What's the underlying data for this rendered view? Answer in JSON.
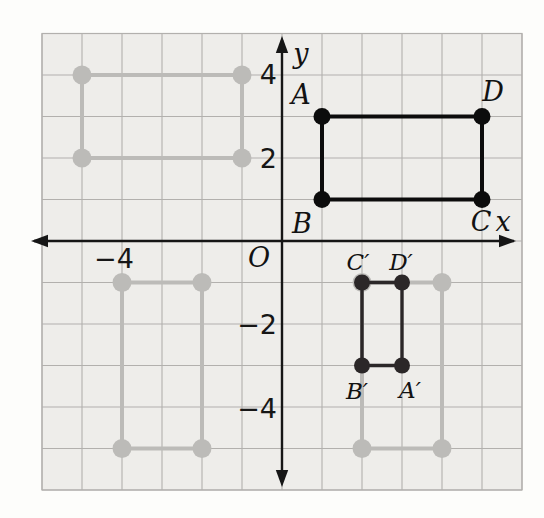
{
  "figure": {
    "grid": {
      "x_min": -6,
      "x_max": 6,
      "y_min": -6,
      "y_max": 5
    },
    "axis": {
      "x_label": {
        "text": "x",
        "x": 503,
        "y": 221
      },
      "y_label": {
        "text": "y",
        "x": 301,
        "y": 53
      },
      "origin_label": {
        "text": "O",
        "x": 259,
        "y": 257
      }
    },
    "x_tick_labels": [
      {
        "name": "x-tick-neg-4",
        "text": "−4",
        "value": -4,
        "dx": -8,
        "dy": 17
      }
    ],
    "y_tick_labels": [
      {
        "name": "y-tick-4",
        "text": "4",
        "value": 4,
        "dx": -5,
        "dy": -1
      },
      {
        "name": "y-tick-2",
        "text": "2",
        "value": 2,
        "dx": -5,
        "dy": 0
      },
      {
        "name": "y-tick-neg-2",
        "text": "−2",
        "value": -2,
        "dx": -5,
        "dy": 0
      },
      {
        "name": "y-tick-neg-4",
        "text": "−4",
        "value": -4,
        "dx": -5,
        "dy": 1
      }
    ],
    "shapes": [
      {
        "name": "ghost-rectangle-top-left",
        "role": "ghost",
        "corners": [
          [
            -5,
            4
          ],
          [
            -1,
            4
          ],
          [
            -1,
            2
          ],
          [
            -5,
            2
          ]
        ]
      },
      {
        "name": "ghost-rectangle-bottom-left",
        "role": "ghost",
        "corners": [
          [
            -4,
            -1
          ],
          [
            -2,
            -1
          ],
          [
            -2,
            -5
          ],
          [
            -4,
            -5
          ]
        ]
      },
      {
        "name": "ghost-rectangle-bottom-right",
        "role": "ghost",
        "corners": [
          [
            2,
            -1
          ],
          [
            4,
            -1
          ],
          [
            4,
            -5
          ],
          [
            2,
            -5
          ]
        ]
      },
      {
        "name": "rectangle-abcd",
        "role": "primary",
        "corners": [
          [
            1,
            3
          ],
          [
            5,
            3
          ],
          [
            5,
            1
          ],
          [
            1,
            1
          ]
        ]
      },
      {
        "name": "rectangle-abcd-image-primed",
        "role": "image",
        "corners": [
          [
            2,
            -1
          ],
          [
            3,
            -1
          ],
          [
            3,
            -3
          ],
          [
            2,
            -3
          ]
        ]
      }
    ],
    "vertex_labels": [
      {
        "name": "vertex-label-a",
        "text": "A",
        "point": [
          1,
          3
        ],
        "dx": -21,
        "dy": -22
      },
      {
        "name": "vertex-label-b",
        "text": "B",
        "point": [
          1,
          1
        ],
        "dx": -20,
        "dy": 24
      },
      {
        "name": "vertex-label-c",
        "text": "C",
        "point": [
          5,
          1
        ],
        "dx": -1,
        "dy": 22
      },
      {
        "name": "vertex-label-d",
        "text": "D",
        "point": [
          5,
          3
        ],
        "dx": 11,
        "dy": -25
      },
      {
        "name": "vertex-label-c-prime",
        "text": "C′",
        "point": [
          2,
          -1
        ],
        "dx": -4,
        "dy": -21
      },
      {
        "name": "vertex-label-d-prime",
        "text": "D′",
        "point": [
          3,
          -1
        ],
        "dx": -1,
        "dy": -21
      },
      {
        "name": "vertex-label-b-prime",
        "text": "B′",
        "point": [
          2,
          -3
        ],
        "dx": -5,
        "dy": 25
      },
      {
        "name": "vertex-label-a-prime",
        "text": "A′",
        "point": [
          3,
          -3
        ],
        "dx": 8,
        "dy": 24
      }
    ],
    "colors": {
      "background": "#fdfdfb",
      "panel": "#eeedea",
      "grid_line": "#b2b0ad",
      "axis": "#161616",
      "primary": "#0c0c0c",
      "ghost": "#bcbbb8",
      "image": "#2b2728",
      "label": "#141414"
    }
  }
}
